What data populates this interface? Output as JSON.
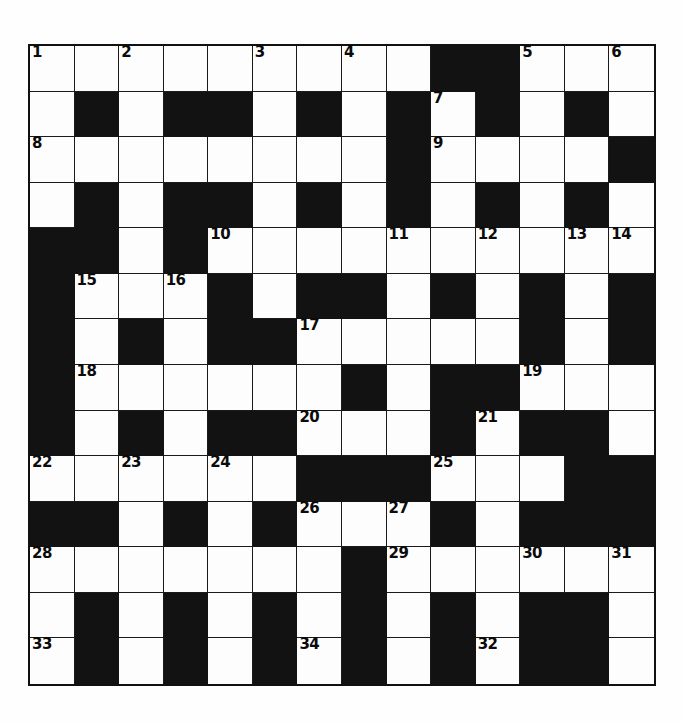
{
  "puzzle": {
    "title": "Crossword Grid",
    "type": "crossword",
    "rows": 14,
    "cols": 14,
    "cell_size_px": 44.6,
    "colors": {
      "block": "#121212",
      "cell": "#fdfdfd",
      "border": "#1a1a1a",
      "number": "#0b0b0b",
      "page_background": "#ffffff"
    },
    "legend": {
      "0": "white (fillable) cell",
      "1": "black (blocked) cell"
    },
    "grid": [
      [
        0,
        0,
        0,
        0,
        0,
        0,
        0,
        0,
        0,
        1,
        1,
        0,
        0,
        0
      ],
      [
        0,
        1,
        0,
        1,
        1,
        0,
        1,
        0,
        1,
        0,
        1,
        0,
        1,
        0
      ],
      [
        0,
        0,
        0,
        0,
        0,
        0,
        0,
        0,
        1,
        0,
        0,
        0,
        0,
        1
      ],
      [
        0,
        1,
        0,
        1,
        1,
        0,
        1,
        0,
        1,
        0,
        1,
        0,
        1,
        0
      ],
      [
        1,
        1,
        0,
        1,
        0,
        0,
        0,
        0,
        0,
        0,
        0,
        0,
        0,
        0
      ],
      [
        1,
        0,
        0,
        0,
        1,
        0,
        1,
        1,
        0,
        1,
        0,
        1,
        0,
        1
      ],
      [
        1,
        0,
        1,
        0,
        1,
        1,
        0,
        0,
        0,
        0,
        0,
        1,
        0,
        1
      ],
      [
        1,
        0,
        0,
        0,
        0,
        0,
        0,
        1,
        0,
        1,
        1,
        0,
        0,
        0
      ],
      [
        1,
        0,
        1,
        0,
        1,
        1,
        0,
        0,
        0,
        1,
        0,
        1,
        1,
        0
      ],
      [
        0,
        0,
        0,
        0,
        0,
        0,
        1,
        1,
        1,
        0,
        0,
        0,
        1,
        1
      ],
      [
        1,
        1,
        0,
        1,
        0,
        1,
        0,
        0,
        0,
        1,
        0,
        1,
        1,
        1
      ],
      [
        0,
        0,
        0,
        0,
        0,
        0,
        0,
        1,
        0,
        0,
        0,
        0,
        0,
        0
      ],
      [
        0,
        1,
        0,
        1,
        0,
        1,
        0,
        1,
        0,
        1,
        0,
        1,
        1,
        0
      ],
      [
        0,
        1,
        0,
        1,
        0,
        1,
        0,
        1,
        0,
        1,
        0,
        1,
        1,
        0
      ]
    ],
    "numbers": [
      {
        "n": 1,
        "row": 0,
        "col": 0
      },
      {
        "n": 2,
        "row": 0,
        "col": 2
      },
      {
        "n": 3,
        "row": 0,
        "col": 5
      },
      {
        "n": 4,
        "row": 0,
        "col": 7
      },
      {
        "n": 5,
        "row": 0,
        "col": 11
      },
      {
        "n": 6,
        "row": 0,
        "col": 13
      },
      {
        "n": 7,
        "row": 1,
        "col": 9
      },
      {
        "n": 8,
        "row": 2,
        "col": 0
      },
      {
        "n": 9,
        "row": 2,
        "col": 9
      },
      {
        "n": 10,
        "row": 4,
        "col": 4
      },
      {
        "n": 11,
        "row": 4,
        "col": 8
      },
      {
        "n": 12,
        "row": 4,
        "col": 10
      },
      {
        "n": 13,
        "row": 4,
        "col": 12
      },
      {
        "n": 14,
        "row": 4,
        "col": 13
      },
      {
        "n": 15,
        "row": 5,
        "col": 1
      },
      {
        "n": 16,
        "row": 5,
        "col": 3
      },
      {
        "n": 17,
        "row": 6,
        "col": 6
      },
      {
        "n": 18,
        "row": 7,
        "col": 1
      },
      {
        "n": 19,
        "row": 7,
        "col": 11
      },
      {
        "n": 20,
        "row": 8,
        "col": 6
      },
      {
        "n": 21,
        "row": 8,
        "col": 10
      },
      {
        "n": 22,
        "row": 9,
        "col": 0
      },
      {
        "n": 23,
        "row": 9,
        "col": 2
      },
      {
        "n": 24,
        "row": 9,
        "col": 4
      },
      {
        "n": 25,
        "row": 9,
        "col": 9
      },
      {
        "n": 26,
        "row": 10,
        "col": 6
      },
      {
        "n": 27,
        "row": 10,
        "col": 8
      },
      {
        "n": 28,
        "row": 11,
        "col": 0
      },
      {
        "n": 29,
        "row": 11,
        "col": 8
      },
      {
        "n": 30,
        "row": 11,
        "col": 11
      },
      {
        "n": 31,
        "row": 11,
        "col": 13
      },
      {
        "n": 32,
        "row": 13,
        "col": 10
      },
      {
        "n": 33,
        "row": 13,
        "col": 0
      },
      {
        "n": 34,
        "row": 13,
        "col": 6
      }
    ],
    "entries": []
  }
}
